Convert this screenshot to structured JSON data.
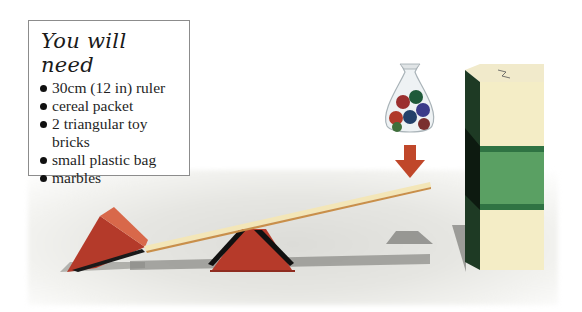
{
  "needs_box": {
    "title": "You will need",
    "items": [
      "30cm (12 in) ruler",
      "cereal packet",
      "2 triangular toy bricks",
      "small plastic bag",
      "marbles"
    ]
  },
  "illustration": {
    "subject": "lever experiment: ruler balanced on triangular toy brick, bag of marbles dropping onto raised end, cereal packet standing beside",
    "colors": {
      "brick": "#c0392b",
      "brick_top": "#d65a3a",
      "ruler": "#f3e4b0",
      "ruler_edge": "#c98f4a",
      "arrow": "#c0472a",
      "box_front": "#f4edc6",
      "box_band": "#4e9a5a",
      "box_stripe": "#2e7040",
      "box_side": "#1f3b24",
      "shadow": "#8a8a86",
      "marbles": "#8b2c2c"
    }
  }
}
